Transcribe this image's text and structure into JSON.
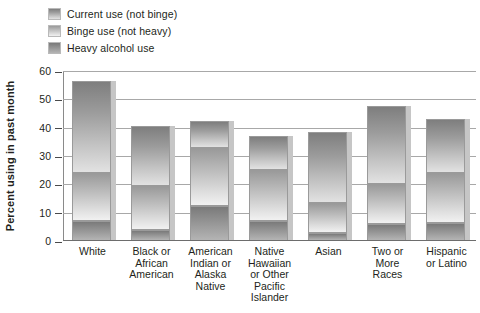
{
  "chart_data": {
    "type": "bar",
    "subtype": "stacked-bar",
    "title": "",
    "xlabel": "",
    "ylabel": "Percent using in past month",
    "ylim": [
      0,
      60
    ],
    "yticks": [
      0,
      10,
      20,
      30,
      40,
      50,
      60
    ],
    "grid": true,
    "legend_position": "top-left",
    "categories": [
      "White",
      "Black or African American",
      "American Indian or Alaska Native",
      "Native Hawaiian or Other Pacific Islander",
      "Asian",
      "Two or More Races",
      "Hispanic or Latino"
    ],
    "series": [
      {
        "name": "Current use (not binge)",
        "color": "#9d9d9d",
        "values": [
          56.5,
          40.5,
          42.5,
          37.0,
          38.5,
          47.5,
          43.0
        ]
      },
      {
        "name": "Binge use (not heavy)",
        "color": "#cfcfcf",
        "values": [
          24.0,
          19.5,
          33.0,
          25.0,
          13.5,
          20.0,
          24.0
        ]
      },
      {
        "name": "Heavy alcohol use",
        "color": "#8c8c8c",
        "values": [
          7.0,
          4.0,
          12.5,
          7.0,
          3.0,
          6.0,
          6.5
        ]
      }
    ],
    "note": "Stacked columns: each series value is the cumulative top of that layer measured from 0."
  },
  "legend": {
    "items": [
      {
        "label": "Current use (not binge)",
        "swatch_class": "seg-current"
      },
      {
        "label": "Binge use (not heavy)",
        "swatch_class": "seg-binge"
      },
      {
        "label": "Heavy alcohol use",
        "swatch_class": "seg-heavy"
      }
    ]
  },
  "axis": {
    "y_title": "Percent using in past month",
    "y_ticks": [
      "0",
      "10",
      "20",
      "30",
      "40",
      "50",
      "60"
    ],
    "x_labels": [
      "White",
      "Black or\nAfrican\nAmerican",
      "American\nIndian or\nAlaska\nNative",
      "Native\nHawaiian\nor Other\nPacific\nIslander",
      "Asian",
      "Two or\nMore\nRaces",
      "Hispanic\nor Latino"
    ]
  },
  "colors": {
    "gridline": "#a8a8a8",
    "baseline": "#6d6d6d",
    "bar_shadow": "#c6c6c6",
    "bar_outline": "#9a9a9a",
    "text": "#231f20",
    "background": "#ffffff"
  }
}
